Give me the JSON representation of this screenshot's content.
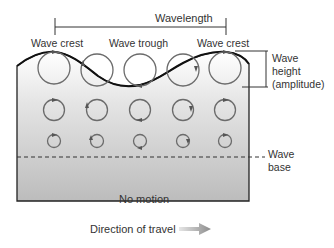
{
  "diagram": {
    "labels": {
      "wavelength": "Wavelength",
      "crest_left": "Wave crest",
      "trough": "Wave trough",
      "crest_right": "Wave crest",
      "wave_height_1": "Wave",
      "wave_height_2": "height",
      "wave_height_3": "(amplitude)",
      "wave_base_1": "Wave",
      "wave_base_2": "base",
      "no_motion": "No motion",
      "direction": "Direction of travel"
    },
    "colors": {
      "water_top": "#ffffff",
      "water_bottom": "#bdbdbd",
      "line": "#222222",
      "orbit": "#6b6b6b",
      "arrow": "#9a9a9a"
    },
    "orbit_rows": [
      {
        "radius": 16,
        "y": 70
      },
      {
        "radius": 11,
        "y": 110
      },
      {
        "radius": 7,
        "y": 141
      }
    ],
    "orbit_columns_x": [
      54,
      98,
      140,
      183,
      225
    ]
  }
}
